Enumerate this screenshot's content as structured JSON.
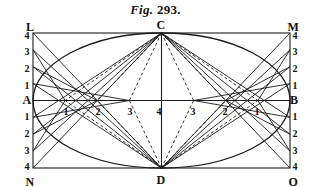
{
  "figure": {
    "title_prefix": "Fig.",
    "title_number": "293.",
    "type": "geometric-construction"
  },
  "geometry": {
    "rect": {
      "left": 33,
      "top": 33,
      "right": 290,
      "bottom": 168
    },
    "center": {
      "x": 161.5,
      "y": 100.5
    },
    "semi_major": 128.5,
    "semi_minor": 67.5,
    "divisions": 4,
    "stroke": "#1a1a1a",
    "line_width": 0.9,
    "dash": "3,2.5"
  },
  "corners": [
    {
      "name": "L",
      "label": "L",
      "x": 30,
      "y": 27,
      "anchor": "right-bottom"
    },
    {
      "name": "M",
      "label": "M",
      "x": 293,
      "y": 27,
      "anchor": "left-bottom"
    },
    {
      "name": "N",
      "label": "N",
      "x": 30,
      "y": 182,
      "anchor": "right-top"
    },
    {
      "name": "O",
      "label": "O",
      "x": 293,
      "y": 182,
      "anchor": "left-top"
    }
  ],
  "axis_points": [
    {
      "name": "A",
      "label": "A",
      "x": 27,
      "y": 100,
      "side": "left"
    },
    {
      "name": "B",
      "label": "B",
      "x": 294,
      "y": 100,
      "side": "right"
    },
    {
      "name": "C",
      "label": "C",
      "x": 161,
      "y": 25,
      "side": "top"
    },
    {
      "name": "D",
      "label": "D",
      "x": 161,
      "y": 180,
      "side": "bottom"
    }
  ],
  "left_edge_labels": [
    {
      "label": "4",
      "x": 27,
      "y": 36
    },
    {
      "label": "3",
      "x": 27,
      "y": 52
    },
    {
      "label": "2",
      "x": 27,
      "y": 69
    },
    {
      "label": "1",
      "x": 27,
      "y": 86
    },
    {
      "label": "1",
      "x": 27,
      "y": 117
    },
    {
      "label": "2",
      "x": 27,
      "y": 134
    },
    {
      "label": "3",
      "x": 27,
      "y": 151
    },
    {
      "label": "4",
      "x": 27,
      "y": 167
    }
  ],
  "right_edge_labels": [
    {
      "label": "4",
      "x": 295,
      "y": 36
    },
    {
      "label": "3",
      "x": 295,
      "y": 52
    },
    {
      "label": "2",
      "x": 295,
      "y": 69
    },
    {
      "label": "1",
      "x": 295,
      "y": 86
    },
    {
      "label": "1",
      "x": 295,
      "y": 117
    },
    {
      "label": "2",
      "x": 295,
      "y": 134
    },
    {
      "label": "3",
      "x": 295,
      "y": 151
    },
    {
      "label": "4",
      "x": 295,
      "y": 167
    }
  ],
  "horizontal_axis_labels": [
    {
      "label": "1",
      "x": 66,
      "y": 112
    },
    {
      "label": "2",
      "x": 98,
      "y": 112
    },
    {
      "label": "3",
      "x": 130,
      "y": 112
    },
    {
      "label": "4",
      "x": 159,
      "y": 112
    },
    {
      "label": "3",
      "x": 193,
      "y": 112
    },
    {
      "label": "2",
      "x": 225,
      "y": 112
    },
    {
      "label": "1",
      "x": 257,
      "y": 112
    }
  ]
}
